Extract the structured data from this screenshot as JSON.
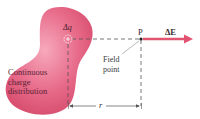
{
  "diagram": {
    "blob_label_lines": [
      "Continuous",
      "charge",
      "distribution"
    ],
    "charge_element_label": "Δq",
    "point_label": "P",
    "field_label_lines": [
      "Field",
      "point"
    ],
    "vector_label": "ΔE",
    "distance_label": "r",
    "colors": {
      "blob": "#e0607e",
      "blob_highlight": "#f49ab0",
      "vector": "#e25372",
      "dashes": "#555555",
      "text": "#3a2a30"
    }
  }
}
